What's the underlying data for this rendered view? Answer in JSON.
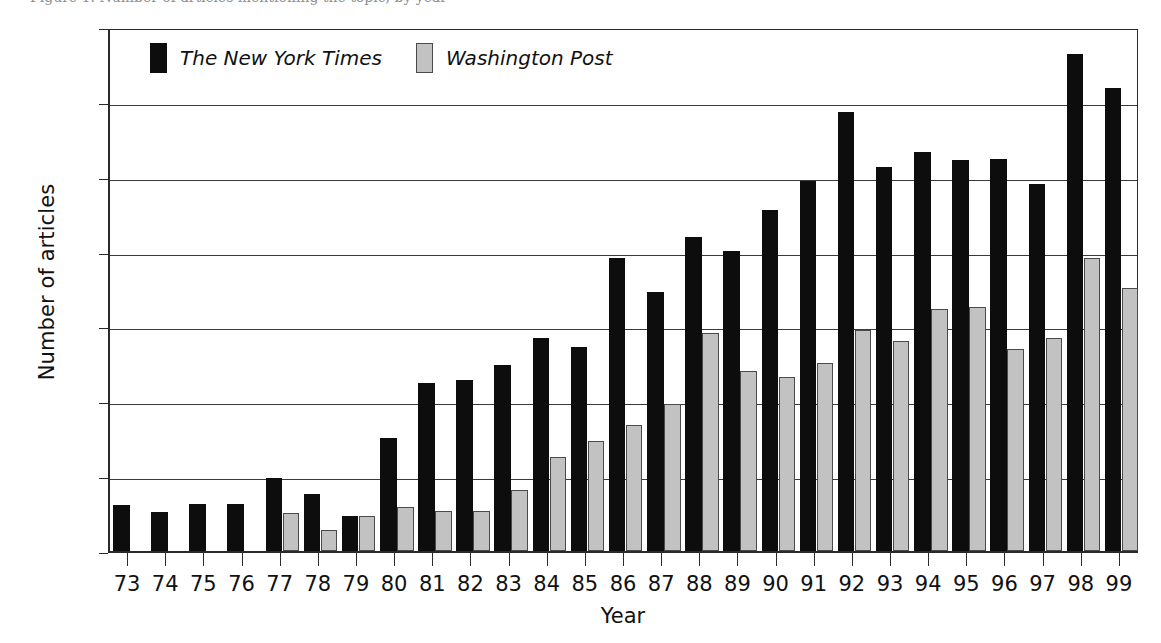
{
  "figure": {
    "caption_partial": "Figure 1. Number of articles mentioning the topic, by year",
    "background_color": "#ffffff"
  },
  "legend": {
    "position": "top-left-inside",
    "entries": [
      {
        "label": "The New York Times",
        "color": "#0d0d0d",
        "swatch": "black-square-swatch"
      },
      {
        "label": "Washington Post",
        "color": "#c2c2c2",
        "swatch": "gray-square-swatch"
      }
    ]
  },
  "chart_data": {
    "type": "bar",
    "title": "",
    "xlabel": "Year",
    "ylabel": "Number of articles",
    "ylim": [
      0,
      700
    ],
    "ytick_labels": [
      "0",
      "100",
      "200",
      "300",
      "400",
      "500",
      "600",
      "700"
    ],
    "ytick_values": [
      0,
      100,
      200,
      300,
      400,
      500,
      600,
      700
    ],
    "ytick_step": 100,
    "grid": true,
    "grid_axis": "y",
    "legend_position": "upper left",
    "categories": [
      "73",
      "74",
      "75",
      "76",
      "77",
      "78",
      "79",
      "80",
      "81",
      "82",
      "83",
      "84",
      "85",
      "86",
      "87",
      "88",
      "89",
      "90",
      "91",
      "92",
      "93",
      "94",
      "95",
      "96",
      "97",
      "98",
      "99"
    ],
    "series": [
      {
        "name": "The New York Times",
        "color": "#0d0d0d",
        "values": [
          62,
          52,
          63,
          63,
          97,
          76,
          47,
          151,
          224,
          228,
          248,
          285,
          272,
          391,
          346,
          419,
          401,
          456,
          494,
          587,
          513,
          533,
          523,
          524,
          490,
          664,
          619
        ]
      },
      {
        "name": "Washington Post",
        "color": "#c2c2c2",
        "values": [
          0,
          0,
          0,
          0,
          51,
          28,
          47,
          59,
          53,
          53,
          82,
          126,
          147,
          169,
          196,
          291,
          240,
          233,
          251,
          295,
          280,
          323,
          326,
          270,
          284,
          391,
          352
        ]
      }
    ]
  }
}
